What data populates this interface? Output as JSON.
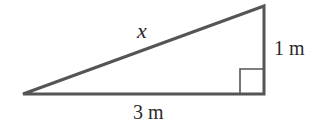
{
  "diagram": {
    "type": "right-triangle",
    "labels": {
      "hypotenuse": "x",
      "vertical_leg": "1 m",
      "horizontal_leg": "3 m"
    },
    "colors": {
      "stroke": "#555555",
      "text": "#2a2a2a",
      "background": "#ffffff"
    }
  }
}
